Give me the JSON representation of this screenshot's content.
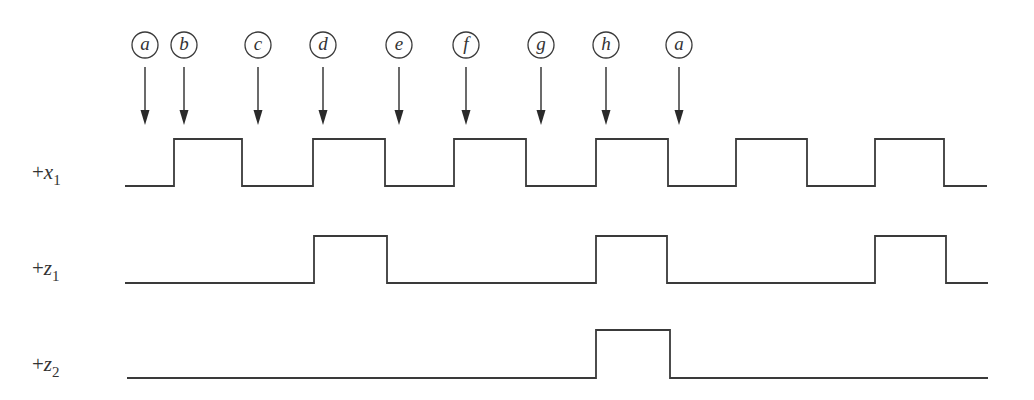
{
  "diagram": {
    "title": "",
    "stroke_color": "#3a3a3a",
    "markers": [
      {
        "label": "a",
        "x": 145
      },
      {
        "label": "b",
        "x": 184
      },
      {
        "label": "c",
        "x": 258
      },
      {
        "label": "d",
        "x": 323
      },
      {
        "label": "e",
        "x": 399
      },
      {
        "label": "f",
        "x": 466
      },
      {
        "label": "g",
        "x": 541
      },
      {
        "label": "h",
        "x": 606
      },
      {
        "label": "a",
        "x": 679
      }
    ],
    "signals": [
      {
        "name": "x1",
        "prefix": "+",
        "var": "x",
        "subscript": "1",
        "label_y": 172,
        "low_y": 186,
        "high_y": 139,
        "start_x": 125,
        "end_x": 987,
        "high_intervals": [
          [
            174,
            242
          ],
          [
            313,
            385
          ],
          [
            454,
            526
          ],
          [
            596,
            668
          ],
          [
            736,
            807
          ],
          [
            875,
            944
          ]
        ]
      },
      {
        "name": "z1",
        "prefix": "+",
        "var": "z",
        "subscript": "1",
        "label_y": 268,
        "low_y": 283,
        "high_y": 236,
        "start_x": 125,
        "end_x": 988,
        "high_intervals": [
          [
            314,
            387
          ],
          [
            596,
            667
          ],
          [
            875,
            946
          ]
        ]
      },
      {
        "name": "z2",
        "prefix": "+",
        "var": "z",
        "subscript": "2",
        "label_y": 364,
        "low_y": 378,
        "high_y": 330,
        "start_x": 127,
        "end_x": 988,
        "high_intervals": [
          [
            596,
            670
          ]
        ]
      }
    ]
  }
}
